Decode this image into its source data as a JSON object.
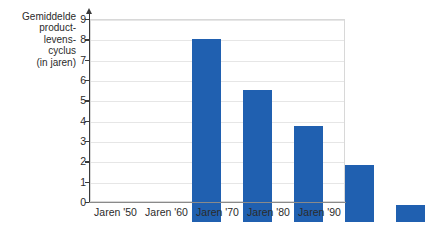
{
  "chart_data": {
    "type": "bar",
    "title": "",
    "xlabel": "",
    "ylabel": "Gemiddelde\nproduct-\nlevens-\ncyclus\n(in jaren)",
    "categories": [
      "Jaren '50",
      "Jaren '60",
      "Jaren '70",
      "Jaren '80",
      "Jaren '90"
    ],
    "values": [
      9.0,
      6.5,
      4.7,
      2.8,
      0.85
    ],
    "series": [
      {
        "name": "Gemiddelde productlevenscyclus",
        "values": [
          9.0,
          6.5,
          4.7,
          2.8,
          0.85
        ]
      }
    ],
    "ylim": [
      0,
      9
    ],
    "xlim": [
      0,
      5
    ],
    "y_ticks": [
      0,
      1,
      2,
      3,
      4,
      5,
      6,
      7,
      8,
      9
    ],
    "y_tick_labels": [
      "0",
      "1",
      "2",
      "3",
      "4",
      "5",
      "6",
      "7",
      "8",
      "9"
    ],
    "grid": true,
    "grid_axis": "y",
    "legend": false,
    "legend_position": "none",
    "bar_color": "#2060b0",
    "axis_color": "#3a3a3a",
    "grid_color": "#e6e6e6",
    "frame_color": "#d8d8d8",
    "text_color": "#2b2b2b",
    "background": "#ffffff"
  }
}
